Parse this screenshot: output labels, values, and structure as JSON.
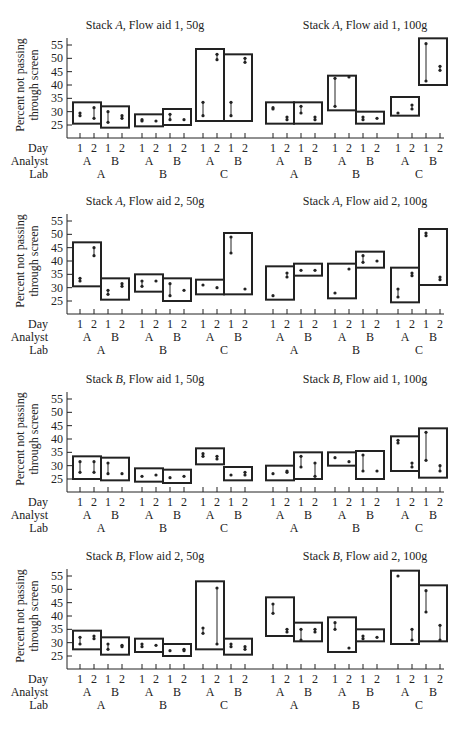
{
  "figure": {
    "ylabel_line1": "Percent not passing",
    "ylabel_line2": "through screen",
    "row_labels": {
      "day": "Day",
      "analyst": "Analyst",
      "lab": "Lab"
    },
    "yticks": [
      25,
      30,
      35,
      40,
      45,
      50,
      55
    ],
    "days": [
      "1",
      "2"
    ],
    "analysts": [
      "A",
      "B"
    ],
    "labs": [
      "A",
      "B",
      "C"
    ],
    "colors": {
      "ink": "#222222",
      "background": "#ffffff"
    }
  },
  "chart_data": [
    {
      "type": "box",
      "title": "Stack A, Flow aid 1, 50g",
      "title_parts": [
        "Stack ",
        "A",
        ", Flow aid 1, 50g"
      ],
      "ylabel": "Percent not passing through screen",
      "ylim": [
        20,
        57
      ],
      "groups": [
        {
          "lab": "A",
          "analyst": "A",
          "box": [
            25.5,
            33.5
          ],
          "day1": [
            28.5,
            29.5
          ],
          "day2": [
            27.5,
            31.5
          ]
        },
        {
          "lab": "A",
          "analyst": "B",
          "box": [
            24,
            32
          ],
          "day1": [
            26,
            30
          ],
          "day2": [
            27.5,
            28.5
          ]
        },
        {
          "lab": "B",
          "analyst": "A",
          "box": [
            24.5,
            29
          ],
          "day1": [
            26.5,
            27
          ],
          "day2": [
            26.5
          ]
        },
        {
          "lab": "B",
          "analyst": "B",
          "box": [
            25,
            31
          ],
          "day1": [
            27,
            29
          ],
          "day2": [
            27
          ]
        },
        {
          "lab": "C",
          "analyst": "A",
          "box": [
            26.5,
            53.5
          ],
          "day1": [
            28.5,
            33.5
          ],
          "day2": [
            49.5,
            51.5
          ]
        },
        {
          "lab": "C",
          "analyst": "B",
          "box": [
            26.5,
            51.5
          ],
          "day1": [
            28.5,
            33.5
          ],
          "day2": [
            48.5,
            50
          ]
        }
      ],
      "note": "Panel split across two subtitles; second half is 100g"
    },
    {
      "type": "box",
      "title": "Stack A, Flow aid 1, 100g",
      "title_parts": [
        "Stack ",
        "A",
        ", Flow aid 1, 100g"
      ],
      "ylim": [
        20,
        57
      ],
      "groups": [
        {
          "lab": "A",
          "analyst": "A",
          "box": [
            25.5,
            33.5
          ],
          "day1": [
            31,
            31.5
          ],
          "day2": [
            27,
            28
          ]
        },
        {
          "lab": "A",
          "analyst": "B",
          "box": [
            25.5,
            33.5
          ],
          "day1": [
            29.5,
            32
          ],
          "day2": [
            27,
            28
          ]
        },
        {
          "lab": "B",
          "analyst": "A",
          "box": [
            30.5,
            43.5
          ],
          "day1": [
            32,
            42.5
          ],
          "day2": [
            43
          ]
        },
        {
          "lab": "B",
          "analyst": "B",
          "box": [
            25.5,
            30
          ],
          "day1": [
            27,
            28
          ],
          "day2": [
            27.5
          ]
        },
        {
          "lab": "C",
          "analyst": "A",
          "box": [
            28.5,
            35.5
          ],
          "day1": [
            29.5
          ],
          "day2": [
            31,
            32.5
          ]
        },
        {
          "lab": "C",
          "analyst": "B",
          "box": [
            40,
            57.5
          ],
          "day1": [
            41.5,
            55.5
          ],
          "day2": [
            45.5,
            47
          ]
        }
      ]
    },
    {
      "type": "box",
      "title": "Stack A, Flow aid 2, 50g",
      "title_parts": [
        "Stack ",
        "A",
        ", Flow aid 2, 50g"
      ],
      "ylim": [
        20,
        57
      ],
      "groups": [
        {
          "lab": "A",
          "analyst": "A",
          "box": [
            30.5,
            47
          ],
          "day1": [
            32.5,
            33.5
          ],
          "day2": [
            42,
            45
          ]
        },
        {
          "lab": "A",
          "analyst": "B",
          "box": [
            25.5,
            33.5
          ],
          "day1": [
            27.5,
            29
          ],
          "day2": [
            30.5,
            31.5
          ]
        },
        {
          "lab": "B",
          "analyst": "A",
          "box": [
            28.5,
            35
          ],
          "day1": [
            30.5,
            32.5
          ],
          "day2": [
            32.5
          ]
        },
        {
          "lab": "B",
          "analyst": "B",
          "box": [
            25,
            33.5
          ],
          "day1": [
            27,
            31.5
          ],
          "day2": [
            29
          ]
        },
        {
          "lab": "C",
          "analyst": "A",
          "box": [
            27.5,
            33
          ],
          "day1": [
            31
          ],
          "day2": [
            30
          ]
        },
        {
          "lab": "C",
          "analyst": "B",
          "box": [
            27.5,
            50.5
          ],
          "day1": [
            43,
            49
          ],
          "day2": [
            29.5
          ]
        }
      ]
    },
    {
      "type": "box",
      "title": "Stack A, Flow aid 2, 100g",
      "title_parts": [
        "Stack ",
        "A",
        ", Flow aid 2, 100g"
      ],
      "ylim": [
        20,
        57
      ],
      "groups": [
        {
          "lab": "A",
          "analyst": "A",
          "box": [
            25.5,
            38
          ],
          "day1": [
            27
          ],
          "day2": [
            34,
            35.5
          ]
        },
        {
          "lab": "A",
          "analyst": "B",
          "box": [
            34.5,
            39
          ],
          "day1": [
            36.5
          ],
          "day2": [
            36.5
          ]
        },
        {
          "lab": "B",
          "analyst": "A",
          "box": [
            26,
            39
          ],
          "day1": [
            28
          ],
          "day2": [
            37
          ]
        },
        {
          "lab": "B",
          "analyst": "B",
          "box": [
            37.5,
            43.5
          ],
          "day1": [
            39.5,
            42
          ],
          "day2": [
            40
          ]
        },
        {
          "lab": "C",
          "analyst": "A",
          "box": [
            24.5,
            37.5
          ],
          "day1": [
            26.5,
            29.5
          ],
          "day2": [
            34.5,
            35.5
          ]
        },
        {
          "lab": "C",
          "analyst": "B",
          "box": [
            31,
            52
          ],
          "day1": [
            49.5,
            50.5
          ],
          "day2": [
            33,
            34
          ]
        }
      ]
    },
    {
      "type": "box",
      "title": "Stack B, Flow aid 1, 50g",
      "title_parts": [
        "Stack ",
        "B",
        ", Flow aid 1, 50g"
      ],
      "ylim": [
        20,
        57
      ],
      "groups": [
        {
          "lab": "A",
          "analyst": "A",
          "box": [
            25,
            33.5
          ],
          "day1": [
            27.5,
            31.5
          ],
          "day2": [
            27.5,
            31.5
          ]
        },
        {
          "lab": "A",
          "analyst": "B",
          "box": [
            24.5,
            33
          ],
          "day1": [
            27,
            31
          ],
          "day2": [
            27
          ]
        },
        {
          "lab": "B",
          "analyst": "A",
          "box": [
            24,
            29
          ],
          "day1": [
            26
          ],
          "day2": [
            26.5
          ]
        },
        {
          "lab": "B",
          "analyst": "B",
          "box": [
            23.5,
            28.5
          ],
          "day1": [
            25.5
          ],
          "day2": [
            26
          ]
        },
        {
          "lab": "C",
          "analyst": "A",
          "box": [
            30.5,
            36.5
          ],
          "day1": [
            33.5,
            34.5
          ],
          "day2": [
            32.5,
            33.5
          ]
        },
        {
          "lab": "C",
          "analyst": "B",
          "box": [
            24.5,
            29.5
          ],
          "day1": [
            26.5
          ],
          "day2": [
            26.5,
            27.5
          ]
        }
      ]
    },
    {
      "type": "box",
      "title": "Stack B, Flow aid 1, 100g",
      "title_parts": [
        "Stack ",
        "B",
        ", Flow aid 1, 100g"
      ],
      "ylim": [
        20,
        57
      ],
      "groups": [
        {
          "lab": "A",
          "analyst": "A",
          "box": [
            24.5,
            30
          ],
          "day1": [
            27
          ],
          "day2": [
            27.5,
            28
          ]
        },
        {
          "lab": "A",
          "analyst": "B",
          "box": [
            25,
            35
          ],
          "day1": [
            29.5,
            33.5
          ],
          "day2": [
            26,
            31
          ]
        },
        {
          "lab": "B",
          "analyst": "A",
          "box": [
            30,
            35
          ],
          "day1": [
            33
          ],
          "day2": [
            31.5
          ]
        },
        {
          "lab": "B",
          "analyst": "B",
          "box": [
            25,
            35.5
          ],
          "day1": [
            28,
            34
          ],
          "day2": [
            28
          ]
        },
        {
          "lab": "C",
          "analyst": "A",
          "box": [
            28,
            41
          ],
          "day1": [
            38.5,
            39.5
          ],
          "day2": [
            29.5,
            31
          ]
        },
        {
          "lab": "C",
          "analyst": "B",
          "box": [
            25.5,
            44
          ],
          "day1": [
            32,
            42.5
          ],
          "day2": [
            28,
            30
          ]
        }
      ]
    },
    {
      "type": "box",
      "title": "Stack B, Flow aid 2, 50g",
      "title_parts": [
        "Stack ",
        "B",
        ", Flow aid 2, 50g"
      ],
      "ylim": [
        20,
        57
      ],
      "groups": [
        {
          "lab": "A",
          "analyst": "A",
          "box": [
            27.5,
            34.5
          ],
          "day1": [
            29.5,
            32
          ],
          "day2": [
            31.5,
            32.5
          ]
        },
        {
          "lab": "A",
          "analyst": "B",
          "box": [
            25.5,
            32
          ],
          "day1": [
            27.5,
            29.5
          ],
          "day2": [
            28.5,
            29
          ]
        },
        {
          "lab": "B",
          "analyst": "A",
          "box": [
            26.5,
            31.5
          ],
          "day1": [
            28.5,
            29.5
          ],
          "day2": [
            29
          ]
        },
        {
          "lab": "B",
          "analyst": "B",
          "box": [
            25,
            29.5
          ],
          "day1": [
            27
          ],
          "day2": [
            27,
            27.5
          ]
        },
        {
          "lab": "C",
          "analyst": "A",
          "box": [
            27.5,
            53
          ],
          "day1": [
            33.5,
            35.5
          ],
          "day2": [
            29.5,
            50.5
          ]
        },
        {
          "lab": "C",
          "analyst": "B",
          "box": [
            25.5,
            31.5
          ],
          "day1": [
            28.5,
            29.5
          ],
          "day2": [
            27.5,
            28.5
          ]
        }
      ]
    },
    {
      "type": "box",
      "title": "Stack B, Flow aid 2, 100g",
      "title_parts": [
        "Stack ",
        "B",
        ", Flow aid 2, 100g"
      ],
      "ylim": [
        20,
        57
      ],
      "groups": [
        {
          "lab": "A",
          "analyst": "A",
          "box": [
            32.5,
            47
          ],
          "day1": [
            41,
            44.5
          ],
          "day2": [
            34,
            35
          ]
        },
        {
          "lab": "A",
          "analyst": "B",
          "box": [
            30.5,
            37.5
          ],
          "day1": [
            31,
            35
          ],
          "day2": [
            34,
            35
          ]
        },
        {
          "lab": "B",
          "analyst": "A",
          "box": [
            26.5,
            39.5
          ],
          "day1": [
            35,
            37.5
          ],
          "day2": [
            28
          ]
        },
        {
          "lab": "B",
          "analyst": "B",
          "box": [
            30.5,
            35
          ],
          "day1": [
            31.5,
            32.5
          ],
          "day2": [
            32
          ]
        },
        {
          "lab": "C",
          "analyst": "A",
          "box": [
            29.5,
            57
          ],
          "day1": [
            55
          ],
          "day2": [
            31,
            35
          ]
        },
        {
          "lab": "C",
          "analyst": "B",
          "box": [
            30.5,
            51.5
          ],
          "day1": [
            41.5,
            49.5
          ],
          "day2": [
            31,
            36.5
          ]
        }
      ]
    }
  ]
}
